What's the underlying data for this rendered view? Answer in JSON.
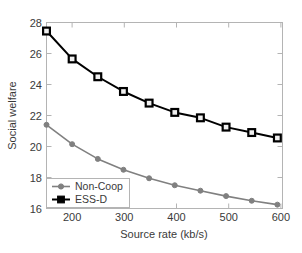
{
  "chart_data": {
    "type": "line",
    "title": "",
    "subtitle": "",
    "xlabel": "Source rate (kb/s)",
    "ylabel": "Social welfare",
    "x": [
      150,
      200,
      250,
      300,
      350,
      400,
      450,
      500,
      550,
      600
    ],
    "xlim": [
      150,
      610
    ],
    "ylim": [
      16,
      28
    ],
    "xticks": [
      200,
      300,
      400,
      500,
      600
    ],
    "xtick_labels": [
      "200",
      "300",
      "400",
      "500",
      "600"
    ],
    "yticks": [
      16,
      18,
      20,
      22,
      24,
      26,
      28
    ],
    "ytick_labels": [
      "16",
      "18",
      "20",
      "22",
      "24",
      "26",
      "28"
    ],
    "grid": false,
    "legend_position": "lower left",
    "series": [
      {
        "name": "Non-Coop",
        "color": "#808080",
        "marker": "circle",
        "values": [
          21.4,
          20.15,
          19.2,
          18.5,
          17.95,
          17.5,
          17.15,
          16.8,
          16.5,
          16.25
        ]
      },
      {
        "name": "ESS-D",
        "color": "#000000",
        "marker": "square",
        "values": [
          27.45,
          25.65,
          24.5,
          23.55,
          22.8,
          22.2,
          21.85,
          21.25,
          20.9,
          20.55
        ]
      }
    ]
  },
  "axes": {
    "x_title": "Source rate (kb/s)",
    "y_title": "Social welfare",
    "x_tick_labels": [
      "200",
      "300",
      "400",
      "500",
      "600"
    ],
    "y_tick_labels": [
      "28",
      "26",
      "24",
      "22",
      "20",
      "18",
      "16"
    ]
  },
  "legend": {
    "items": [
      {
        "label": "Non-Coop",
        "marker": "circle-marker",
        "color": "#808080"
      },
      {
        "label": "ESS-D",
        "marker": "square-marker",
        "color": "#000000"
      }
    ]
  },
  "colors": {
    "non_coop": "#808080",
    "ess_d": "#000000",
    "axis": "#b4b4b4",
    "text": "#3a3a3a",
    "background": "#ffffff"
  }
}
